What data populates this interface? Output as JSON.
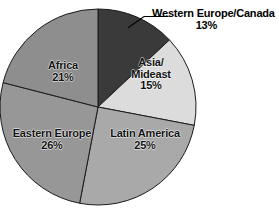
{
  "chart_data": {
    "type": "pie",
    "title": "",
    "subtitle": "",
    "xlabel": "",
    "ylabel": "",
    "legend_position": "none",
    "grid": false,
    "value_suffix": "%",
    "categories": [
      "Western Europe/Canada",
      "Asia/Mideast",
      "Latin America",
      "Eastern Europe",
      "Africa"
    ],
    "values": [
      13,
      15,
      25,
      26,
      21
    ],
    "slices": [
      {
        "label": "Western Europe/Canada",
        "label_line1": "Western Europe/Canada",
        "label_line2": "",
        "value": 13,
        "value_text": "13%",
        "color": "#3a3a3a",
        "label_placement": "external",
        "leader_line": true
      },
      {
        "label": "Asia/Mideast",
        "label_line1": "Asia/",
        "label_line2": "Mideast",
        "value": 15,
        "value_text": "15%",
        "color": "#dcdcdc",
        "label_placement": "internal",
        "leader_line": false
      },
      {
        "label": "Latin America",
        "label_line1": "Latin America",
        "label_line2": "",
        "value": 25,
        "value_text": "25%",
        "color": "#a9a9a9",
        "label_placement": "internal",
        "leader_line": false
      },
      {
        "label": "Eastern Europe",
        "label_line1": "Eastern Europe",
        "label_line2": "",
        "value": 26,
        "value_text": "26%",
        "color": "#979797",
        "label_placement": "internal",
        "leader_line": false
      },
      {
        "label": "Africa",
        "label_line1": "Africa",
        "label_line2": "",
        "value": 21,
        "value_text": "21%",
        "color": "#8e8e8e",
        "label_placement": "internal",
        "leader_line": false
      }
    ],
    "geometry": {
      "center_x": 98,
      "center_y": 107,
      "radius": 98,
      "start_angle_deg": 0,
      "direction": "clockwise"
    },
    "style": {
      "background": "#ffffff",
      "slice_outline": "#1a1a1a",
      "label_text_color": "#111111",
      "dark_slice_text_color": "#f2f2f2"
    }
  }
}
